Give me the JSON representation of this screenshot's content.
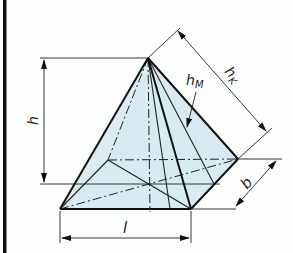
{
  "figure": {
    "labels": {
      "height": "h",
      "apothem_sub_main": "h",
      "apothem_sub": "M",
      "edge_height_main": "h",
      "edge_height_sub": "K",
      "base_length": "l",
      "base_width": "b"
    },
    "colors": {
      "fill": "#d6eaf0",
      "line": "#111111",
      "border": "#111111",
      "background": "#fdfefe"
    }
  }
}
